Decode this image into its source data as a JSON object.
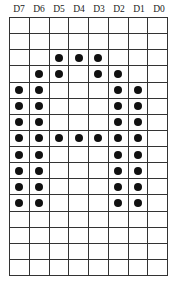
{
  "diagram": {
    "title": "",
    "column_labels": [
      "D7",
      "D6",
      "D5",
      "D4",
      "D3",
      "D2",
      "D1",
      "D0"
    ],
    "rows": 16,
    "columns": 8,
    "dot_color": "#111111",
    "grid_color": "#333333",
    "bitmap": [
      [
        0,
        0,
        0,
        0,
        0,
        0,
        0,
        0
      ],
      [
        0,
        0,
        0,
        0,
        0,
        0,
        0,
        0
      ],
      [
        0,
        0,
        1,
        1,
        1,
        0,
        0,
        0
      ],
      [
        0,
        1,
        1,
        0,
        1,
        1,
        0,
        0
      ],
      [
        1,
        1,
        0,
        0,
        0,
        1,
        1,
        0
      ],
      [
        1,
        1,
        0,
        0,
        0,
        1,
        1,
        0
      ],
      [
        1,
        1,
        0,
        0,
        0,
        1,
        1,
        0
      ],
      [
        1,
        1,
        1,
        1,
        1,
        1,
        1,
        0
      ],
      [
        1,
        1,
        0,
        0,
        0,
        1,
        1,
        0
      ],
      [
        1,
        1,
        0,
        0,
        0,
        1,
        1,
        0
      ],
      [
        1,
        1,
        0,
        0,
        0,
        1,
        1,
        0
      ],
      [
        1,
        1,
        0,
        0,
        0,
        1,
        1,
        0
      ],
      [
        0,
        0,
        0,
        0,
        0,
        0,
        0,
        0
      ],
      [
        0,
        0,
        0,
        0,
        0,
        0,
        0,
        0
      ],
      [
        0,
        0,
        0,
        0,
        0,
        0,
        0,
        0
      ],
      [
        0,
        0,
        0,
        0,
        0,
        0,
        0,
        0
      ]
    ],
    "row_hex": [
      "00",
      "00",
      "38",
      "6C",
      "C6",
      "C6",
      "C6",
      "FE",
      "C6",
      "C6",
      "C6",
      "C6",
      "00",
      "00",
      "00",
      "00"
    ]
  }
}
